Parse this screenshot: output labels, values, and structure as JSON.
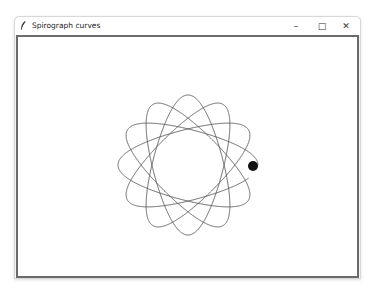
{
  "window": {
    "title": "Spirograph curves",
    "icon": "feather-icon",
    "controls": {
      "minimize": "–",
      "maximize": "□",
      "close": "✕"
    }
  },
  "canvas": {
    "background": "#ffffff",
    "curve": {
      "type": "hypotrochoid",
      "center_x": 188,
      "center_y": 165,
      "R": 42,
      "r": 24.5,
      "d": 52.5,
      "rotation_deg": 0,
      "color": "#555555",
      "stroke_width": 0.9,
      "progress": 0.985
    },
    "pen_dot": {
      "x": 253,
      "y": 166,
      "radius": 5,
      "color": "#111111"
    }
  }
}
